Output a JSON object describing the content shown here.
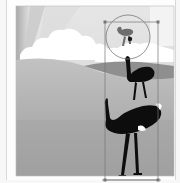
{
  "canvas": {
    "width": 180,
    "height": 183,
    "background": "#f7f7f7",
    "art_frame": {
      "x": 16,
      "y": 6,
      "w": 158,
      "h": 170
    }
  },
  "scene": {
    "sky_color": "#d6d6d6",
    "cloud_color": "#ffffff",
    "hill_far_color": "#9a9a9a",
    "ground_color": "#a8a8a8",
    "ground_dark_color": "#8e8e8e",
    "silhouette_color": "#0d0d0d",
    "ray_color": "#bdbdbd"
  },
  "objects": [
    {
      "name": "ostrich-small",
      "x": 118,
      "y": 22,
      "scale": 0.35,
      "tone": "#6d6d6d"
    },
    {
      "name": "ostrich-medium",
      "x": 140,
      "y": 82,
      "scale": 0.7,
      "tone": "#0d0d0d"
    },
    {
      "name": "ostrich-large",
      "x": 130,
      "y": 160,
      "scale": 1.0,
      "tone": "#0d0d0d"
    }
  ],
  "selection": {
    "bounds": {
      "x": 105,
      "y": 22,
      "w": 53,
      "h": 158
    },
    "magnifier": {
      "cx": 128,
      "cy": 37,
      "r": 22
    },
    "stroke": "#777777"
  }
}
